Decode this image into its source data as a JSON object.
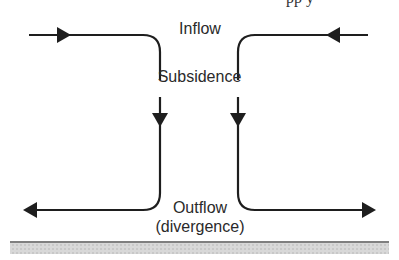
{
  "diagram": {
    "type": "airflow-schematic",
    "labels": {
      "top": "Inflow",
      "middle": "Subsidence",
      "bottom_line1": "Outflow",
      "bottom_line2": "(divergence)"
    },
    "clipped_header_text": "pp y",
    "colors": {
      "line": "#1e1e1e",
      "text": "#2a2a2a",
      "ground_line": "#555555",
      "ground_fill": "#d4d4d4"
    }
  }
}
